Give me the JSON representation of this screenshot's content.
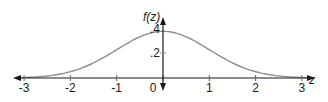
{
  "chart_data": {
    "type": "line",
    "title": "",
    "xlabel": "z",
    "ylabel": "f(z)",
    "series": [
      {
        "name": "standard normal density",
        "x": [
          -3,
          -2.5,
          -2,
          -1.5,
          -1,
          -0.5,
          0,
          0.5,
          1,
          1.5,
          2,
          2.5,
          3
        ],
        "values": [
          0.0044,
          0.0175,
          0.054,
          0.1295,
          0.242,
          0.3521,
          0.3989,
          0.3521,
          0.242,
          0.1295,
          0.054,
          0.0175,
          0.0044
        ]
      }
    ],
    "x_ticks": [
      "-3",
      "-2",
      "-1",
      "0",
      "1",
      "2",
      "3"
    ],
    "y_ticks": [
      ".2",
      ".4"
    ],
    "xlim": [
      -3.3,
      3.3
    ],
    "ylim": [
      0,
      0.45
    ],
    "grid": false,
    "legend": null,
    "colors": {
      "curve": "#8c8c8c",
      "axis": "#1a1a1a"
    }
  },
  "labels": {
    "y_axis": "f(z)",
    "x_axis": "z",
    "x_ticks": [
      "-3",
      "-2",
      "-1",
      "0",
      "1",
      "2",
      "3"
    ],
    "y_ticks": [
      ".2",
      ".4"
    ]
  }
}
